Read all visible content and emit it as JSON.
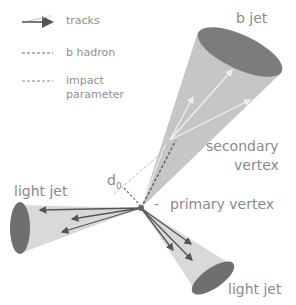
{
  "legend": {
    "items": [
      {
        "icon": "tracks-arrows-icon",
        "label": "tracks"
      },
      {
        "icon": "b-hadron-dashed-line-icon",
        "label": "b hadron"
      },
      {
        "icon": "impact-parameter-dashed-line-icon",
        "label": "impact",
        "label2": "parameter"
      }
    ]
  },
  "labels": {
    "b_jet": "b jet",
    "secondary_vertex_line1": "secondary",
    "secondary_vertex_line2": "vertex",
    "primary_vertex": "primary vertex",
    "light_jet_left": "light jet",
    "light_jet_bottom": "light jet",
    "d0": "d",
    "d0_sub": "0",
    "pv_dash": "-"
  },
  "colors": {
    "cone_fill": "#c4c4c4",
    "cone_cap": "#7a7a7a",
    "light_cone_fill": "#d8d8d8",
    "track": "#555555",
    "text": "#8a8a8a"
  }
}
